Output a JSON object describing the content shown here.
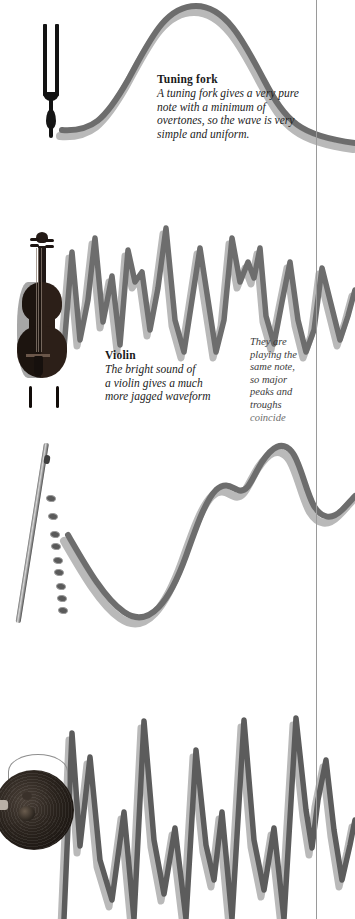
{
  "page": {
    "background": "#ffffff",
    "rule_color": "#9a9a9a",
    "wave_color": "#6d6d6d",
    "wave_shadow_color": "#b9b9b9"
  },
  "captions": {
    "tuning_fork": {
      "title": "Tuning fork",
      "lines": [
        "A tuning fork gives a very pure",
        "note with a minimum of",
        "overtones, so the wave is very",
        "simple and uniform."
      ]
    },
    "violin": {
      "title": "Violin",
      "lines": [
        "The bright sound of",
        "a violin gives a much",
        "more jagged waveform"
      ]
    },
    "same_note": {
      "title": "",
      "lines": [
        "They are",
        "playing the",
        "same note,",
        "so major",
        "peaks and",
        "troughs",
        "coincide"
      ]
    }
  },
  "instruments": [
    {
      "name": "tuning-fork",
      "label": "Tuning fork"
    },
    {
      "name": "violin",
      "label": "Violin"
    },
    {
      "name": "flute",
      "label": "Flute"
    },
    {
      "name": "gong",
      "label": "Gong"
    }
  ],
  "chart_data": {
    "type": "line",
    "xlabel": "Time",
    "ylabel": "Amplitude",
    "grid": false,
    "legend": "none",
    "annotations": [
      "Tuning fork: A tuning fork gives a very pure note with a minimum of overtones, so the wave is very simple and uniform.",
      "Violin: The bright sound of a violin gives a much more jagged waveform",
      "They are playing the same note, so major peaks and troughs coincide"
    ],
    "series": [
      {
        "name": "Tuning fork",
        "description": "smooth single sine hump - pure tone, minimum overtones",
        "path": "M 62 130 C 92 132 105 120 128 80 C 150 40 165 6 196 6 C 226 6 244 42 264 80 C 286 122 300 136 355 143"
      },
      {
        "name": "Violin",
        "description": "jagged sawtooth-like waveform with many overtones",
        "path": "M 64 348 L 72 252 L 80 340 L 88 300 L 95 238 L 103 322 L 112 276 L 120 345 L 128 250 L 135 282 L 142 272 L 150 330 L 158 288 L 166 228 L 175 320 L 184 352 L 192 300 L 200 248 L 208 300 L 216 352 L 224 320 L 232 238 L 240 282 L 248 262 L 254 278 L 260 248 L 266 316 L 274 344 L 282 302 L 290 262 L 298 320 L 306 352 L 314 330 L 322 268 L 330 300 L 340 340 L 348 316 L 355 290"
      },
      {
        "name": "Flute",
        "description": "smooth rounded wave with a secondary shoulder bump",
        "path": "M 68 535 C 86 566 104 598 124 612 C 150 630 170 600 186 556 C 198 522 206 500 216 490 C 226 481 232 488 238 490 C 248 494 252 478 262 462 C 272 447 282 440 292 452 C 300 461 306 492 314 506 C 322 519 332 520 342 510 C 350 502 353 498 355 496"
      },
      {
        "name": "Gong",
        "description": "very jagged high-overtone zigzag waveform",
        "path": "M 64 919 L 72 733 L 80 846 L 90 757 L 100 860 L 112 900 L 124 812 L 134 919 L 144 721 L 154 840 L 164 894 L 175 828 L 186 919 L 196 750 L 206 845 L 214 880 L 222 812 L 232 919 L 244 720 L 254 840 L 264 890 L 274 828 L 284 919 L 296 718 L 306 810 L 312 848 L 318 800 L 326 760 L 334 830 L 342 880 L 350 845 L 355 820"
      }
    ]
  }
}
